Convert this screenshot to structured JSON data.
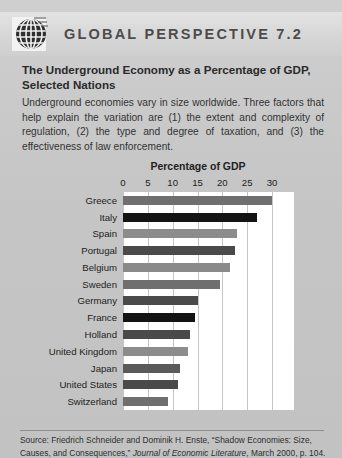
{
  "header": {
    "logo_icon": "globe-grid-icon",
    "title": "GLOBAL PERSPECTIVE 7.2"
  },
  "article": {
    "title": "The Underground Economy as a Percentage of GDP, Selected Nations",
    "intro": "Underground economies vary in size worldwide. Three factors that help explain the variation are (1) the extent and complexity of regulation, (2) the type and degree of taxation, and (3) the effectiveness of law enforcement."
  },
  "source": {
    "prefix": "Source: Friedrich Schneider and Dominik H. Enste, “Shadow Economies: Size, Causes, and Consequences,” ",
    "journal": "Journal of Economic Literature",
    "suffix": ", March 2000, p. 104."
  },
  "colors": {
    "page_background": "#c6c6c6",
    "header_band": "#dcdcdc",
    "plot_background": "#ffffff",
    "gridline": "#c5c5c5",
    "bar_light": "#8a8a8a",
    "bar_dark": "#3f3f3f",
    "bar_black": "#141414",
    "text": "#222222"
  },
  "chart_data": {
    "type": "bar",
    "orientation": "horizontal",
    "title": "Percentage of GDP",
    "xlabel": "Percentage of GDP",
    "ylabel": "",
    "xlim": [
      0,
      30
    ],
    "xticks": [
      0,
      5,
      10,
      15,
      20,
      25,
      30
    ],
    "xtick_labels": [
      "0",
      "5",
      "10",
      "15",
      "20",
      "25",
      "30"
    ],
    "grid": true,
    "legend": false,
    "categories": [
      "Greece",
      "Italy",
      "Spain",
      "Portugal",
      "Belgium",
      "Sweden",
      "Germany",
      "France",
      "Holland",
      "United Kingdom",
      "Japan",
      "United States",
      "Switzerland"
    ],
    "values": [
      30.0,
      27.0,
      23.0,
      22.5,
      21.5,
      19.5,
      15.0,
      14.5,
      13.5,
      13.0,
      11.5,
      11.0,
      9.0
    ],
    "bar_colors": [
      "#6f6f6f",
      "#141414",
      "#8c8c8c",
      "#4a4a4a",
      "#8a8a8a",
      "#6f6f6f",
      "#4a4a4a",
      "#141414",
      "#4a4a4a",
      "#8c8c8c",
      "#5a5a5a",
      "#4a4a4a",
      "#6f6f6f"
    ]
  }
}
